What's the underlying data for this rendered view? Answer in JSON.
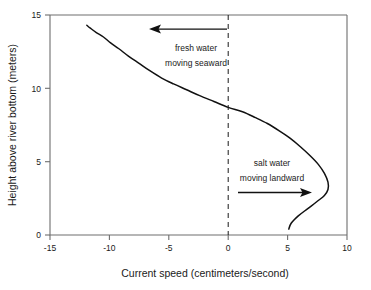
{
  "chart_data": {
    "type": "line",
    "title": "",
    "subtitle": "",
    "xlabel": "Current speed (centimeters/second)",
    "ylabel": "Height above river bottom (meters)",
    "xlim": [
      -15,
      10
    ],
    "ylim": [
      0,
      15
    ],
    "xticks": [
      -15,
      -10,
      -5,
      0,
      5,
      10
    ],
    "xticklabels": [
      "-15",
      "-10",
      "-5",
      "0",
      "5",
      "10"
    ],
    "yticks": [
      0,
      5,
      10,
      15
    ],
    "yticklabels": [
      "0",
      "5",
      "10",
      "15"
    ],
    "grid": false,
    "legend": null,
    "orientation": "x-is-speed, y-is-height",
    "series": [
      {
        "name": "Current speed profile",
        "note": "speed (x, cm/s) as a function of height above river bottom (y, meters)",
        "points": [
          {
            "x": 5.1,
            "y": 0.4
          },
          {
            "x": 5.3,
            "y": 0.8
          },
          {
            "x": 5.9,
            "y": 1.3
          },
          {
            "x": 6.7,
            "y": 1.8
          },
          {
            "x": 7.5,
            "y": 2.3
          },
          {
            "x": 8.1,
            "y": 2.7
          },
          {
            "x": 8.4,
            "y": 3.1
          },
          {
            "x": 8.4,
            "y": 3.6
          },
          {
            "x": 8.1,
            "y": 4.2
          },
          {
            "x": 7.6,
            "y": 4.8
          },
          {
            "x": 6.9,
            "y": 5.4
          },
          {
            "x": 6.1,
            "y": 6.0
          },
          {
            "x": 5.2,
            "y": 6.6
          },
          {
            "x": 4.3,
            "y": 7.1
          },
          {
            "x": 3.3,
            "y": 7.6
          },
          {
            "x": 2.3,
            "y": 8.0
          },
          {
            "x": 1.2,
            "y": 8.4
          },
          {
            "x": 0.0,
            "y": 8.7
          },
          {
            "x": -1.2,
            "y": 9.1
          },
          {
            "x": -2.4,
            "y": 9.5
          },
          {
            "x": -3.5,
            "y": 9.9
          },
          {
            "x": -4.6,
            "y": 10.3
          },
          {
            "x": -5.6,
            "y": 10.7
          },
          {
            "x": -6.6,
            "y": 11.2
          },
          {
            "x": -7.5,
            "y": 11.7
          },
          {
            "x": -8.4,
            "y": 12.2
          },
          {
            "x": -9.2,
            "y": 12.7
          },
          {
            "x": -9.9,
            "y": 13.1
          },
          {
            "x": -10.5,
            "y": 13.5
          },
          {
            "x": -11.1,
            "y": 13.8
          },
          {
            "x": -11.6,
            "y": 14.1
          },
          {
            "x": -11.9,
            "y": 14.3
          }
        ]
      }
    ],
    "reference_lines": [
      {
        "name": "zero-speed-line",
        "orientation": "vertical",
        "x": 0,
        "style": "dashed"
      }
    ],
    "annotations": [
      {
        "name": "fresh-water-annotation",
        "line1": "fresh water",
        "line2": "moving seaward",
        "arrow_direction": "left",
        "arrow_from_x": -0.1,
        "arrow_to_x": -5.6,
        "arrow_y": 13.8
      },
      {
        "name": "salt-water-annotation",
        "line1": "salt water",
        "line2": "moving landward",
        "arrow_direction": "right",
        "arrow_from_x": 0.2,
        "arrow_to_x": 5.4,
        "arrow_y": 2.9
      }
    ],
    "colors": {
      "curve": "#111111",
      "axis": "#6e6e6e",
      "text": "#1a1a1a",
      "background": "#ffffff",
      "zero_line": "#1a1a1a"
    }
  }
}
